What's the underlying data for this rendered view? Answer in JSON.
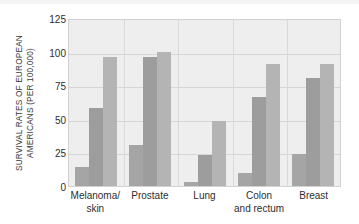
{
  "chart_data": {
    "type": "bar",
    "title": "",
    "subtitle": "",
    "xlabel": "",
    "ylabel": "SURVIVAL RATES OF EUROPEAN AMERICANS (PER 100,000)",
    "ylabel_line1": "SURVIVAL RATES OF EUROPEAN",
    "ylabel_line2": "AMERICANS (PER 100,000)",
    "categories": [
      "Melanoma/ skin",
      "Prostate",
      "Lung",
      "Colon and rectum",
      "Breast"
    ],
    "category_lines": [
      [
        "Melanoma/",
        "skin"
      ],
      [
        "Prostate",
        ""
      ],
      [
        "Lung",
        ""
      ],
      [
        "Colon",
        "and rectum"
      ],
      [
        "Breast",
        ""
      ]
    ],
    "series": [
      {
        "name": "series-1",
        "values": [
          14,
          31,
          3,
          10,
          24
        ]
      },
      {
        "name": "series-2",
        "values": [
          59,
          97,
          23,
          67,
          81
        ]
      },
      {
        "name": "series-3",
        "values": [
          97,
          101,
          49,
          92,
          92
        ]
      }
    ],
    "ylim": [
      0,
      125
    ],
    "yticks": [
      0,
      25,
      50,
      75,
      100,
      125
    ],
    "ytick_labels": [
      "0",
      "25",
      "50",
      "75",
      "100",
      "125"
    ],
    "grid": true,
    "legend": "none",
    "colors": {
      "series_1": "#a5a5a5",
      "series_2": "#9d9d9d",
      "series_3": "#b4b4b4",
      "plot_background": "#eeeeee",
      "gridline": "#d6d6d6",
      "axis_text": "#2e2e2e",
      "page_background": "#ffffff"
    }
  }
}
